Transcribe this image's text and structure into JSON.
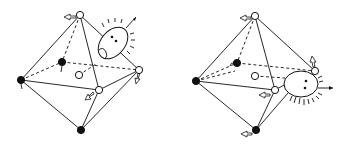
{
  "figure": {
    "panels": [
      {
        "id": "left",
        "vertices": {
          "top": {
            "x": 80,
            "y": 15,
            "type": "open"
          },
          "left": {
            "x": 21,
            "y": 80,
            "type": "filled"
          },
          "back": {
            "x": 62,
            "y": 62,
            "type": "filled"
          },
          "center": {
            "x": 79,
            "y": 75,
            "type": "open"
          },
          "right": {
            "x": 139,
            "y": 70,
            "type": "open"
          },
          "front": {
            "x": 99,
            "y": 90,
            "type": "open"
          },
          "bottom": {
            "x": 81,
            "y": 130,
            "type": "filled"
          }
        },
        "face": {
          "cx": 113,
          "cy": 43,
          "rx": 12,
          "ry": 18,
          "rotate": 40
        }
      },
      {
        "id": "right",
        "vertices": {
          "top": {
            "x": 255,
            "y": 16,
            "type": "open"
          },
          "left": {
            "x": 196,
            "y": 81,
            "type": "filled"
          },
          "back": {
            "x": 237,
            "y": 63,
            "type": "filled"
          },
          "center": {
            "x": 255,
            "y": 76,
            "type": "open"
          },
          "right": {
            "x": 315,
            "y": 71,
            "type": "open"
          },
          "front": {
            "x": 275,
            "y": 90,
            "type": "open"
          },
          "bottom": {
            "x": 256,
            "y": 130,
            "type": "filled"
          }
        },
        "face": {
          "cx": 301,
          "cy": 84,
          "rx": 17,
          "ry": 13,
          "rotate": 0
        }
      }
    ],
    "colors": {
      "line": "#111111",
      "background": "#ffffff"
    }
  }
}
